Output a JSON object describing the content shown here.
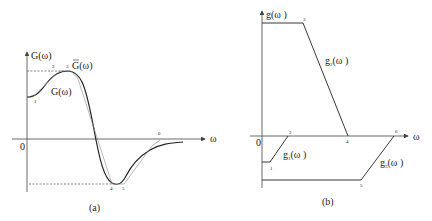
{
  "figure": {
    "panel_a": {
      "caption": "(a)",
      "y_axis_label": "G(ω)",
      "x_axis_label": "ω",
      "origin_label": "0",
      "curve_label": "G(ω)",
      "approx_label": "G(ω)",
      "approx_label_overbar": true,
      "point_labels": [
        "1",
        "2",
        "3",
        "4",
        "5",
        "6"
      ]
    },
    "panel_b": {
      "caption": "(b)",
      "y_axis_label": "g(ω )",
      "x_axis_label": "ω",
      "origin_label": "0",
      "segment_labels": {
        "g2": "g",
        "g2_sub": "2",
        "g2_arg": "(ω )",
        "g1": "g",
        "g1_sub": "1",
        "g1_arg": "(ω )",
        "g3": "g",
        "g3_sub": "3",
        "g3_arg": "(ω )"
      },
      "point_labels": [
        "1",
        "2",
        "3",
        "4",
        "5",
        "6"
      ]
    },
    "colors": {
      "line": "#222222",
      "axis": "#444444",
      "dashed": "#555555",
      "approx": "#888888"
    }
  }
}
